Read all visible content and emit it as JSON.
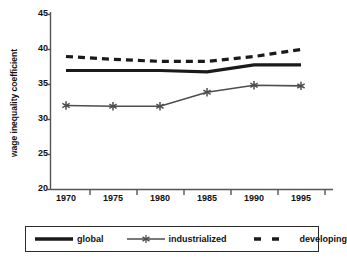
{
  "chart_data": {
    "type": "line",
    "title": "",
    "xlabel": "",
    "ylabel": "wage inequality coefficient",
    "x": [
      1970,
      1975,
      1980,
      1985,
      1990,
      1995
    ],
    "xtick_labels": [
      "1970",
      "1975",
      "1980",
      "1985",
      "1990",
      "1995"
    ],
    "ytick_labels": [
      "20",
      "25",
      "30",
      "35",
      "40",
      "45"
    ],
    "yticks": [
      20,
      25,
      30,
      35,
      40,
      45
    ],
    "ylim": [
      20,
      45
    ],
    "grid": false,
    "legend_position": "bottom",
    "series": [
      {
        "name": "global",
        "style": "solid-thick",
        "color": "#1a1a1a",
        "values": [
          37.0,
          37.0,
          37.0,
          36.8,
          37.8,
          37.8
        ]
      },
      {
        "name": "industrialized",
        "style": "solid-thin-marker",
        "marker": "asterisk",
        "color": "#4d4d4d",
        "values": [
          32.0,
          31.9,
          31.9,
          33.9,
          34.9,
          34.8
        ]
      },
      {
        "name": "developing",
        "style": "dashed-thick",
        "color": "#1a1a1a",
        "values": [
          39.0,
          38.6,
          38.3,
          38.3,
          39.0,
          40.0
        ]
      }
    ]
  },
  "legend": {
    "items": [
      {
        "label": "global"
      },
      {
        "label": "industrialized"
      },
      {
        "label": "developing"
      }
    ]
  }
}
